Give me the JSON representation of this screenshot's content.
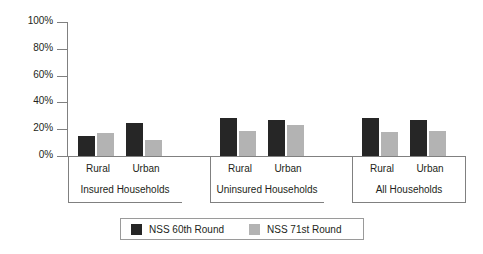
{
  "chart_data": {
    "type": "bar",
    "title": "",
    "subtitle": "",
    "xlabel": "",
    "ylabel": "",
    "ylim": [
      0,
      100
    ],
    "y_ticks": [
      "0%",
      "20%",
      "40%",
      "60%",
      "80%",
      "100%"
    ],
    "y_tick_values": [
      0,
      20,
      40,
      60,
      80,
      100
    ],
    "grid": false,
    "legend_position": "bottom",
    "value_unit": "%",
    "groups": [
      {
        "name": "Insured Households",
        "categories": [
          "Rural",
          "Urban"
        ],
        "series": [
          {
            "name": "NSS 60th Round",
            "values": [
              15,
              25
            ]
          },
          {
            "name": "NSS 71st Round",
            "values": [
              17,
              12
            ]
          }
        ]
      },
      {
        "name": "Uninsured Households",
        "categories": [
          "Rural",
          "Urban"
        ],
        "series": [
          {
            "name": "NSS 60th Round",
            "values": [
              28,
              27
            ]
          },
          {
            "name": "NSS 71st Round",
            "values": [
              19,
              23
            ]
          }
        ]
      },
      {
        "name": "All Households",
        "categories": [
          "Rural",
          "Urban"
        ],
        "series": [
          {
            "name": "NSS 60th Round",
            "values": [
              28,
              27
            ]
          },
          {
            "name": "NSS 71st Round",
            "values": [
              18,
              19
            ]
          }
        ]
      }
    ],
    "legend": [
      {
        "label": "NSS 60th Round",
        "color": "#262626"
      },
      {
        "label": "NSS 71st Round",
        "color": "#b3b3b3"
      }
    ],
    "colors": {
      "series_60th": "#262626",
      "series_71st": "#b3b3b3",
      "axis": "#808080",
      "text": "#231f20",
      "background": "#ffffff"
    }
  }
}
